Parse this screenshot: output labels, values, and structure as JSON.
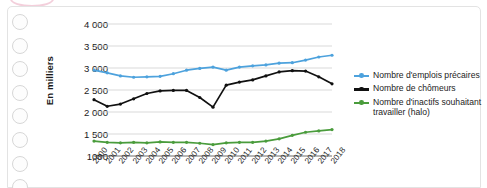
{
  "chart_data": {
    "type": "line",
    "title": "",
    "xlabel": "",
    "ylabel": "En milliers",
    "ylim": [
      1000,
      4000
    ],
    "ytick_labels": [
      "1000",
      "1 500",
      "2 000",
      "2 500",
      "3 000",
      "3 500",
      "4 000"
    ],
    "ytick_values": [
      1000,
      1500,
      2000,
      2500,
      3000,
      3500,
      4000
    ],
    "grid": true,
    "legend_position": "right",
    "categories": [
      "2000",
      "2001",
      "2002",
      "2003",
      "2004",
      "2005",
      "2006",
      "2007",
      "2008",
      "2009",
      "2010",
      "2011",
      "2012",
      "2013",
      "2014",
      "2015",
      "2016",
      "2017",
      "2018"
    ],
    "series": [
      {
        "name": "Nombre d'emplois précaires",
        "color": "#4da2dd",
        "values": [
          2950,
          2890,
          2820,
          2790,
          2800,
          2810,
          2870,
          2950,
          2990,
          3020,
          2950,
          3020,
          3050,
          3070,
          3110,
          3120,
          3180,
          3250,
          3290
        ]
      },
      {
        "name": "Nombre de chômeurs",
        "color": "#111111",
        "values": [
          2280,
          2130,
          2180,
          2300,
          2420,
          2480,
          2490,
          2490,
          2330,
          2110,
          2610,
          2680,
          2730,
          2820,
          2910,
          2940,
          2930,
          2800,
          2640
        ]
      },
      {
        "name": "Nombre d'inactifs souhaitant travailler (halo)",
        "color": "#4a9c3c",
        "values": [
          1340,
          1310,
          1300,
          1310,
          1300,
          1320,
          1310,
          1310,
          1290,
          1260,
          1300,
          1310,
          1310,
          1340,
          1390,
          1470,
          1540,
          1570,
          1600
        ]
      }
    ]
  },
  "legend": {
    "items": [
      {
        "label": "Nombre d'emplois précaires",
        "color": "#4da2dd"
      },
      {
        "label": "Nombre de chômeurs",
        "color": "#111111"
      },
      {
        "label": "Nombre d'inactifs souhaitant travailler (halo)",
        "color": "#4a9c3c"
      }
    ]
  },
  "decoration": {
    "punch_hole_count": 8
  }
}
